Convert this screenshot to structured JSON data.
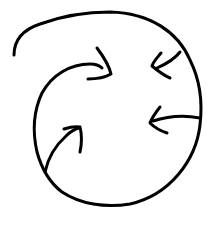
{
  "figure": {
    "description": "Hand-drawn circle with four arrows pointing inward toward the center",
    "icon": "converge-arrows-circle-icon",
    "stroke_color": "#000000",
    "background_color": "#ffffff",
    "stroke_width": 3,
    "arrows": [
      {
        "id": "arrow-upper-left",
        "direction": "right"
      },
      {
        "id": "arrow-upper-right",
        "direction": "down-left"
      },
      {
        "id": "arrow-right",
        "direction": "left"
      },
      {
        "id": "arrow-lower-left",
        "direction": "up-right"
      }
    ]
  }
}
